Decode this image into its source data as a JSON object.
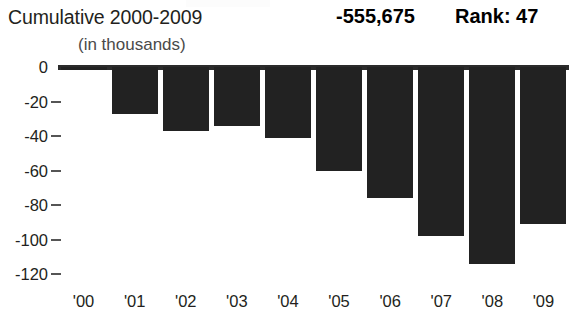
{
  "header": {
    "title": "Cumulative 2000-2009",
    "total": "-555,675",
    "rank": "Rank: 47",
    "units": "(in thousands)"
  },
  "chart_data": {
    "type": "bar",
    "title": "Cumulative 2000-2009",
    "subtitle": "(in thousands)",
    "xlabel": "",
    "ylabel": "",
    "categories": [
      "'00",
      "'01",
      "'02",
      "'03",
      "'04",
      "'05",
      "'06",
      "'07",
      "'08",
      "'09"
    ],
    "values": [
      -2,
      -27,
      -37,
      -34,
      -41,
      -60,
      -76,
      -98,
      -114,
      -91
    ],
    "ylim": [
      -120,
      0
    ],
    "yticks": [
      0,
      -20,
      -40,
      -60,
      -80,
      -100,
      -120
    ],
    "ytick_labels": [
      "0",
      "-20",
      "-40",
      "-60",
      "-80",
      "-100",
      "-120"
    ],
    "grid": false,
    "legend": null,
    "annotations": [
      {
        "text": "-555,675",
        "role": "cumulative-total"
      },
      {
        "text": "Rank: 47",
        "role": "rank"
      }
    ],
    "bar_color": "#222222",
    "axis_color": "#2b2b2b"
  }
}
